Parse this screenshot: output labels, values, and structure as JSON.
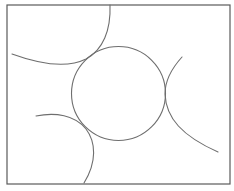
{
  "diagram": {
    "width": 234,
    "height": 191,
    "background": "#ffffff",
    "frame": {
      "label": "rectangle-frame",
      "x": 7,
      "y": 5,
      "width": 223,
      "height": 179,
      "stroke": "#5a5a5a",
      "stroke_width": 1.2
    },
    "central_circle": {
      "label": "central-circle",
      "cx": 118.5,
      "cy": 93.5,
      "r": 47,
      "stroke": "#6e6e6e",
      "stroke_width": 1.1
    },
    "arcs": [
      {
        "label": "top-left-arc",
        "d": "M 110 5 C 111 30 103 50 86 59 C 70 67 45 66 12 54",
        "stroke": "#6e6e6e",
        "stroke_width": 1.1
      },
      {
        "label": "right-arc",
        "d": "M 182 57 C 172 68 165 80 165 94 C 166 118 182 136 218 152",
        "stroke": "#6e6e6e",
        "stroke_width": 1.1
      },
      {
        "label": "bottom-left-arc",
        "d": "M 36 116 C 55 112 75 115 86 129 C 96 142 97 162 84 183",
        "stroke": "#6e6e6e",
        "stroke_width": 1.1
      }
    ]
  }
}
